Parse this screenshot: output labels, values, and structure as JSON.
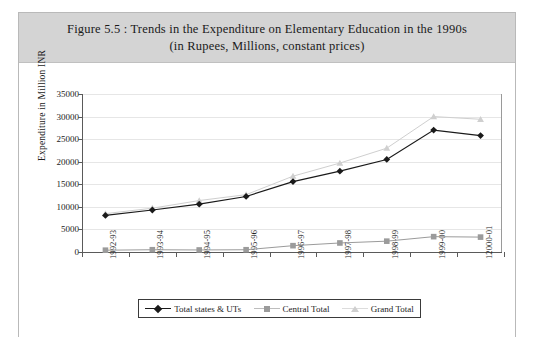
{
  "figure": {
    "title_line1": "Figure 5.5 : Trends in the Expenditure on Elementary Education in the 1990s",
    "title_line2": "(in Rupees, Millions, constant prices)"
  },
  "chart_data": {
    "type": "line",
    "title": "Figure 5.5 : Trends in the Expenditure on Elementary Education in the 1990s (in Rupees, Millions, constant prices)",
    "xlabel": "",
    "ylabel": "Expenditure in Million INR",
    "ylim": [
      0,
      35000
    ],
    "yticks": [
      "0",
      "5000",
      "10000",
      "15000",
      "20000",
      "25000",
      "30000",
      "35000"
    ],
    "grid": true,
    "legend_position": "bottom",
    "categories": [
      "1992-93",
      "1993-94",
      "1994-95",
      "1995-96",
      "1996-97",
      "1997-98",
      "1998-99",
      "1999-00",
      "12000-01"
    ],
    "series": [
      {
        "name": "Total states & UTs",
        "marker": "diamond",
        "color": "#1a1a1a",
        "values": [
          8100,
          9300,
          10600,
          12300,
          15600,
          17900,
          20500,
          27000,
          25800
        ]
      },
      {
        "name": "Central Total",
        "marker": "square",
        "color": "#9b9b9b",
        "values": [
          400,
          500,
          450,
          500,
          1400,
          2000,
          2400,
          3400,
          3300
        ]
      },
      {
        "name": "Grand Total",
        "marker": "triangle",
        "color": "#cfcfcf",
        "values": [
          8500,
          9700,
          11400,
          12700,
          16800,
          19700,
          23000,
          30000,
          29400
        ]
      }
    ]
  },
  "colors": {
    "title_band": "#d4d4d4",
    "frame_border": "#b9b9b9",
    "gridline": "#e6e6e6",
    "axis": "#5a5a5a"
  }
}
